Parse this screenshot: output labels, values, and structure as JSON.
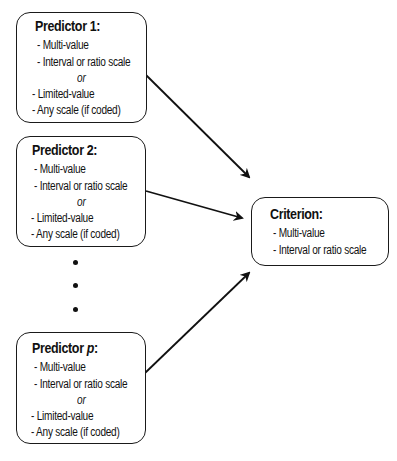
{
  "predictors": [
    {
      "title": "Predictor 1:",
      "title_prefix": "Predictor ",
      "title_var": "1",
      "title_suffix": ":",
      "lines": [
        "- Multi-value",
        "- Interval or ratio scale",
        "or",
        "- Limited-value",
        "- Any scale (if coded)"
      ]
    },
    {
      "title": "Predictor 2:",
      "title_prefix": "Predictor ",
      "title_var": "2",
      "title_suffix": ":",
      "lines": [
        "- Multi-value",
        "- Interval or ratio scale",
        "or",
        "- Limited-value",
        "- Any scale (if coded)"
      ]
    },
    {
      "title": "Predictor p:",
      "title_prefix": "Predictor ",
      "title_var": "p",
      "title_suffix": ":",
      "lines": [
        "- Multi-value",
        "- Interval or ratio scale",
        "or",
        "- Limited-value",
        "- Any scale (if coded)"
      ]
    }
  ],
  "ellipsis_dots": 3,
  "criterion": {
    "title": "Criterion:",
    "lines": [
      "- Multi-value",
      "- Interval or ratio scale"
    ]
  },
  "colors": {
    "stroke": "#1a1a1a",
    "background": "#ffffff",
    "text": "#111111"
  }
}
